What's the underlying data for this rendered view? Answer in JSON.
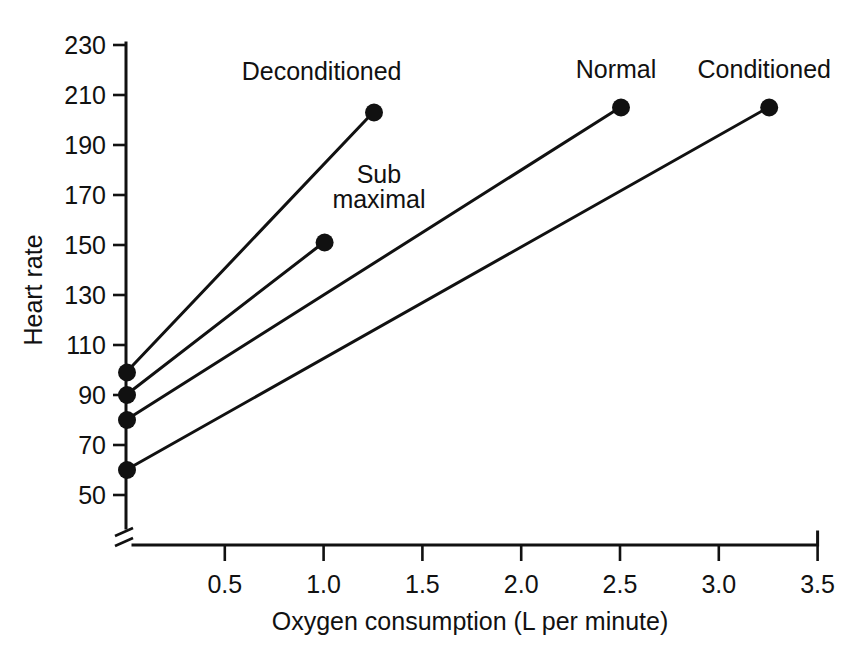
{
  "chart_data": {
    "type": "line",
    "title": "",
    "xlabel": "Oxygen consumption (L per minute)",
    "ylabel": "Heart rate",
    "xlim": [
      0,
      3.5
    ],
    "ylim": [
      50,
      230
    ],
    "x_ticks": [
      0.5,
      1.0,
      1.5,
      2.0,
      2.5,
      3.0,
      3.5
    ],
    "x_tick_labels": [
      "0.5",
      "1.0",
      "1.5",
      "2.0",
      "2.5",
      "3.0",
      "3.5"
    ],
    "y_ticks": [
      50,
      70,
      90,
      110,
      130,
      150,
      170,
      190,
      210,
      230
    ],
    "y_tick_labels": [
      "50",
      "70",
      "90",
      "110",
      "130",
      "150",
      "170",
      "190",
      "210",
      "230"
    ],
    "grid": false,
    "legend": "inline-annotations",
    "axis_break": {
      "present": true,
      "location": "x-axis-origin",
      "symbol": "double-slash"
    },
    "series": [
      {
        "name": "Deconditioned",
        "x": [
          0.0,
          1.25
        ],
        "y": [
          99,
          203
        ],
        "markers_at": [
          [
            0.0,
            99
          ],
          [
            1.25,
            203
          ]
        ],
        "label": "Deconditioned",
        "label_x": 0.99,
        "label_y": 216,
        "label_anchor": "middle"
      },
      {
        "name": "Sub maximal",
        "x": [
          0.0,
          1.0
        ],
        "y": [
          90,
          151
        ],
        "markers_at": [
          [
            0.0,
            90
          ],
          [
            1.0,
            151
          ]
        ],
        "label": "Sub maximal",
        "label_lines": [
          "Sub",
          "maximal"
        ],
        "label_x": 1.28,
        "label_y": 175,
        "label_anchor": "middle"
      },
      {
        "name": "Normal",
        "x": [
          0.0,
          2.5
        ],
        "y": [
          80,
          205
        ],
        "markers_at": [
          [
            0.0,
            80
          ],
          [
            2.5,
            205
          ]
        ],
        "label": "Normal",
        "label_x": 2.48,
        "label_y": 217,
        "label_anchor": "middle"
      },
      {
        "name": "Conditioned",
        "x": [
          0.0,
          3.25
        ],
        "y": [
          60,
          205
        ],
        "markers_at": [
          [
            0.0,
            60
          ],
          [
            3.25,
            205
          ]
        ],
        "label": "Conditioned",
        "label_x": 3.23,
        "label_y": 217,
        "label_anchor": "middle"
      }
    ],
    "colors": {
      "line": "#111111",
      "marker": "#111111",
      "axis": "#111111",
      "background": "#ffffff"
    }
  }
}
